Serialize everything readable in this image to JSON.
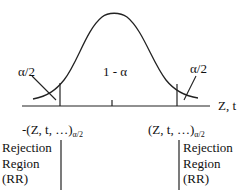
{
  "diagram": {
    "type": "two-tailed normal distribution with rejection regions",
    "curve": {
      "peak_x": 115,
      "peak_y": 13,
      "stroke": "#222222"
    },
    "axis": {
      "label": "Z, t"
    },
    "labels": {
      "left_tail": "α/2",
      "center": "1 - α",
      "right_tail": "α/2"
    },
    "critical_values": {
      "left": {
        "main": "-(Z, t, …)",
        "subscript": "α/2"
      },
      "right": {
        "main": "(Z, t, …)",
        "subscript": "α/2"
      }
    },
    "rejection_regions": {
      "left": {
        "lines": [
          "Rejection",
          "Region",
          "(RR)"
        ]
      },
      "right": {
        "lines": [
          "Rejection",
          "Region",
          "(RR)"
        ]
      }
    }
  }
}
